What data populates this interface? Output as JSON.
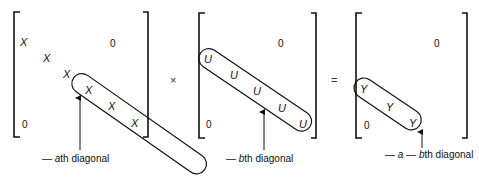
{
  "figure": {
    "matrices": [
      {
        "name": "matrix-a",
        "element_symbol": "X",
        "element_count": 6,
        "elements": [
          "X",
          "X",
          "X",
          "X",
          "X",
          "X"
        ],
        "upper_zero": "0",
        "lower_zero": "0",
        "diagonal_label_prefix": "— ",
        "diagonal_label_var": "a",
        "diagonal_label_suffix": "th diagonal"
      },
      {
        "name": "matrix-b",
        "element_symbol": "U",
        "element_count": 5,
        "elements": [
          "U",
          "U",
          "U",
          "U",
          "U"
        ],
        "upper_zero": "0",
        "lower_zero": "0",
        "diagonal_label_prefix": "— ",
        "diagonal_label_var": "b",
        "diagonal_label_suffix": "th diagonal"
      },
      {
        "name": "matrix-result",
        "element_symbol": "Y",
        "element_count": 3,
        "elements": [
          "Y",
          "Y",
          "Y"
        ],
        "upper_zero": "0",
        "lower_zero": "0",
        "diagonal_label_prefix": "— ",
        "diagonal_label_var1": "a",
        "diagonal_label_mid": " — ",
        "diagonal_label_var2": "b",
        "diagonal_label_suffix": "th diagonal"
      }
    ],
    "operators": {
      "multiply": "×",
      "equals": "="
    }
  }
}
